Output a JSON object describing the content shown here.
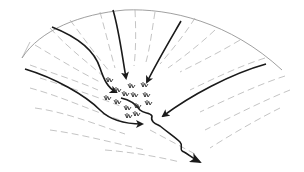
{
  "diagram": {
    "title": "",
    "colors": {
      "background": "#ffffff",
      "outline": "#888888",
      "contour": "#aaaaaa",
      "flow_arrow": "#1a1a1a",
      "vegetation": "#333333"
    },
    "elements": [
      {
        "id": "catchment-outline",
        "type": "arc-boundary"
      },
      {
        "id": "flow-arrow-left-outer",
        "type": "arrow"
      },
      {
        "id": "flow-arrow-left-inner",
        "type": "arrow"
      },
      {
        "id": "flow-arrow-center",
        "type": "arrow"
      },
      {
        "id": "flow-arrow-center-right",
        "type": "arrow"
      },
      {
        "id": "flow-arrow-right",
        "type": "arrow"
      },
      {
        "id": "stream-channel",
        "type": "arrow"
      },
      {
        "id": "vegetation-cluster",
        "type": "tufts",
        "count": 14
      }
    ]
  }
}
